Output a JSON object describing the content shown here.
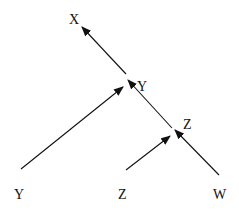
{
  "diagram": {
    "type": "tree",
    "nodes": [
      {
        "id": "x_top",
        "label": "X",
        "x": 75,
        "y": 23
      },
      {
        "id": "y_mid",
        "label": "Y",
        "x": 142,
        "y": 90
      },
      {
        "id": "z_mid",
        "label": "Z",
        "x": 188,
        "y": 128
      },
      {
        "id": "y_bot",
        "label": "Y",
        "x": 19,
        "y": 198
      },
      {
        "id": "z_bot",
        "label": "Z",
        "x": 123,
        "y": 198
      },
      {
        "id": "w_bot",
        "label": "W",
        "x": 220,
        "y": 198
      }
    ],
    "edges": [
      {
        "from": "y_mid",
        "to": "x_top"
      },
      {
        "from": "y_bot",
        "to": "y_mid"
      },
      {
        "from": "z_mid",
        "to": "y_mid"
      },
      {
        "from": "w_bot",
        "to": "z_mid"
      },
      {
        "from": "z_bot",
        "to": "z_mid"
      }
    ]
  },
  "labels": {
    "x_top": "X",
    "y_mid": "Y",
    "z_mid": "Z",
    "y_bot": "Y",
    "z_bot": "Z",
    "w_bot": "W"
  }
}
